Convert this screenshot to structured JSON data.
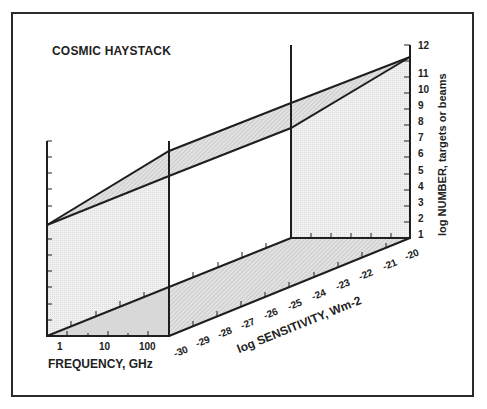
{
  "title": "COSMIC HAYSTACK",
  "frequency_axis": {
    "label": "FREQUENCY, GHz",
    "ticks": [
      "1",
      "10",
      "100"
    ]
  },
  "number_axis": {
    "label": "log NUMBER, targets or beams",
    "ticks": [
      "1",
      "2",
      "3",
      "4",
      "5",
      "6",
      "7",
      "8",
      "9",
      "10",
      "11",
      "12"
    ]
  },
  "sensitivity_axis": {
    "label": "log SENSITIVITY, Wm-2",
    "ticks": [
      "-30",
      "-29",
      "-28",
      "-27",
      "-26",
      "-25",
      "-24",
      "-23",
      "-22",
      "-21",
      "-20"
    ]
  },
  "colors": {
    "line": "#1e1e1e",
    "fill_light": "#ececec",
    "fill_hatch": "#cfcfcf"
  }
}
